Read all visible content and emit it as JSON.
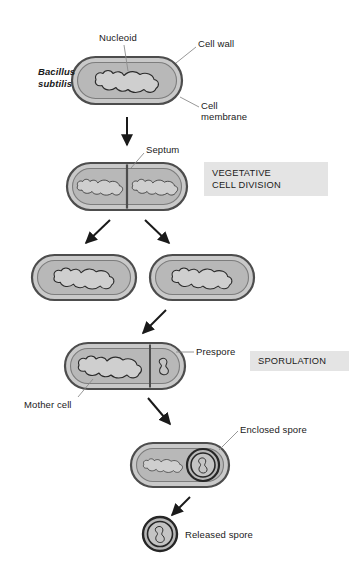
{
  "figure": {
    "organism_label": "Bacillus\nsubtilis",
    "organism_label_line1": "Bacillus",
    "organism_label_line2": "subtilis",
    "type": "life-cycle-diagram"
  },
  "labels": {
    "nucleoid": "Nucleoid",
    "cell_wall": "Cell wall",
    "cell_membrane_line1": "Cell",
    "cell_membrane_line2": "membrane",
    "septum": "Septum",
    "prespore": "Prespore",
    "mother_cell": "Mother cell",
    "enclosed_spore": "Enclosed spore",
    "released_spore": "Released spore"
  },
  "phases": [
    {
      "id": "vegetative",
      "line1": "VEGETATIVE",
      "line2": "CELL DIVISION"
    },
    {
      "id": "sporulation",
      "line1": "SPORULATION",
      "line2": ""
    }
  ],
  "colors": {
    "cell_wall_outline": "#4d4d4d",
    "cell_wall_fill": "#c9c9c9",
    "cytoplasm_fill": "#b8b8b8",
    "nucleoid_fill": "#cfcfcf",
    "nucleoid_outline": "#2b2b2b",
    "spore_coat": "#262626",
    "arrow": "#1a1a1a",
    "leader_line": "#8c8c8c",
    "phase_band": "#e4e4e4",
    "text": "#1a1a1a",
    "background": "#ffffff"
  },
  "stages": [
    {
      "id": "stage-1-vegetative-cell",
      "name": "single vegetative cell with nucleoid"
    },
    {
      "id": "stage-2-septation",
      "name": "cell with septum dividing two nucleoids"
    },
    {
      "id": "stage-3-daughter-cell-left",
      "name": "left daughter cell"
    },
    {
      "id": "stage-3-daughter-cell-right",
      "name": "right daughter cell"
    },
    {
      "id": "stage-4-sporulating-cell",
      "name": "mother cell with prespore"
    },
    {
      "id": "stage-5-enclosed-spore-cell",
      "name": "cell containing enclosed spore"
    },
    {
      "id": "stage-6-released-spore",
      "name": "free released spore"
    }
  ]
}
